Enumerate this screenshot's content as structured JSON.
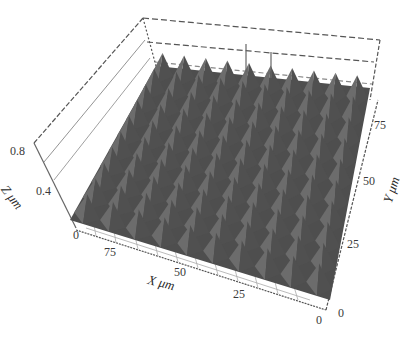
{
  "chart_data": {
    "type": "surface3d",
    "title": "",
    "xlabel": "X μm",
    "ylabel": "Y μm",
    "zlabel": "Z μm",
    "x_ticks": [
      "0",
      "25",
      "50",
      "75"
    ],
    "y_ticks": [
      "0",
      "25",
      "50",
      "75"
    ],
    "z_ticks": [
      "0",
      "0.4",
      "0.8"
    ],
    "xlim": [
      0,
      90
    ],
    "ylim": [
      0,
      90
    ],
    "zlim": [
      0,
      0.8
    ],
    "peaks_per_axis": 10,
    "surface_color": "#5a5a5a",
    "grid": true,
    "box_style": "dashed"
  },
  "labels": {
    "z_title": "Z μm",
    "x_title": "X μm",
    "y_title": "Y μm",
    "z_tick_0": "0",
    "z_tick_04": "0.4",
    "z_tick_08": "0.8",
    "x_tick_0": "0",
    "x_tick_25": "25",
    "x_tick_50": "50",
    "x_tick_75": "75",
    "y_tick_0": "0",
    "y_tick_25": "25",
    "y_tick_50": "50",
    "y_tick_75": "75"
  }
}
